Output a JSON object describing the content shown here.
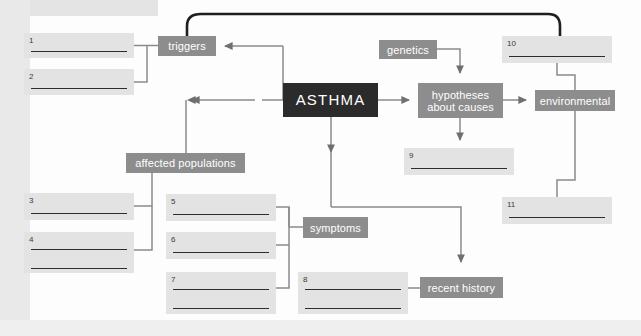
{
  "diagram": {
    "type": "concept-map",
    "colors": {
      "node_grey": "#8d8d8d",
      "node_dark": "#2b2b2b",
      "blank_fill": "#e3e3e3",
      "connector": "#7a7a7a",
      "page": "#fdfdfd",
      "margin": "#e9e9e9",
      "rule_line": "#2e2e2e"
    },
    "nodes": [
      {
        "id": "triggers",
        "label": "triggers",
        "style": "grey",
        "x": 158,
        "y": 36,
        "w": 58,
        "h": 20
      },
      {
        "id": "asthma",
        "label": "ASTHMA",
        "style": "dark",
        "x": 283,
        "y": 83,
        "w": 95,
        "h": 34
      },
      {
        "id": "genetics",
        "label": "genetics",
        "style": "grey",
        "x": 379,
        "y": 40,
        "w": 58,
        "h": 19
      },
      {
        "id": "hypotheses",
        "label": "hypotheses about causes",
        "style": "grey",
        "x": 418,
        "y": 83,
        "w": 85,
        "h": 35
      },
      {
        "id": "environmental",
        "label": "environmental",
        "style": "grey",
        "x": 535,
        "y": 90,
        "w": 80,
        "h": 21
      },
      {
        "id": "affected",
        "label": "affected populations",
        "style": "grey",
        "x": 126,
        "y": 153,
        "w": 119,
        "h": 20
      },
      {
        "id": "symptoms",
        "label": "symptoms",
        "style": "grey",
        "x": 303,
        "y": 217,
        "w": 65,
        "h": 21
      },
      {
        "id": "recent",
        "label": "recent history",
        "style": "grey",
        "x": 420,
        "y": 277,
        "w": 83,
        "h": 21
      }
    ],
    "blanks": [
      {
        "id": "blank-1",
        "number": "1",
        "x": 24,
        "y": 33,
        "w": 110,
        "h": 25,
        "lines": 1
      },
      {
        "id": "blank-2",
        "number": "2",
        "x": 24,
        "y": 69,
        "w": 110,
        "h": 26,
        "lines": 1
      },
      {
        "id": "blank-3",
        "number": "3",
        "x": 24,
        "y": 193,
        "w": 110,
        "h": 27,
        "lines": 1
      },
      {
        "id": "blank-4",
        "number": "4",
        "x": 24,
        "y": 232,
        "w": 110,
        "h": 41,
        "lines": 2
      },
      {
        "id": "blank-5",
        "number": "5",
        "x": 166,
        "y": 194,
        "w": 110,
        "h": 27,
        "lines": 1
      },
      {
        "id": "blank-6",
        "number": "6",
        "x": 166,
        "y": 232,
        "w": 110,
        "h": 27,
        "lines": 1
      },
      {
        "id": "blank-7",
        "number": "7",
        "x": 166,
        "y": 272,
        "w": 110,
        "h": 42,
        "lines": 2
      },
      {
        "id": "blank-8",
        "number": "8",
        "x": 298,
        "y": 272,
        "w": 110,
        "h": 42,
        "lines": 2
      },
      {
        "id": "blank-9",
        "number": "9",
        "x": 404,
        "y": 148,
        "w": 110,
        "h": 27,
        "lines": 1
      },
      {
        "id": "blank-10",
        "number": "10",
        "x": 502,
        "y": 36,
        "w": 110,
        "h": 27,
        "lines": 1
      },
      {
        "id": "blank-11",
        "number": "11",
        "x": 502,
        "y": 197,
        "w": 110,
        "h": 27,
        "lines": 1
      }
    ],
    "connectors": [
      {
        "from": "blank-1",
        "to": "triggers",
        "kind": "bracket"
      },
      {
        "from": "blank-2",
        "to": "triggers",
        "kind": "bracket"
      },
      {
        "from": "asthma",
        "to": "triggers",
        "kind": "arrow-left"
      },
      {
        "from": "asthma",
        "to": "affected",
        "kind": "arrow-left-down"
      },
      {
        "from": "asthma",
        "to": "hypotheses",
        "kind": "arrow-right"
      },
      {
        "from": "asthma",
        "to": "symptoms",
        "kind": "arrow-down"
      },
      {
        "from": "genetics",
        "to": "hypotheses",
        "kind": "arrow-up"
      },
      {
        "from": "hypotheses",
        "to": "environmental",
        "kind": "arrow-right"
      },
      {
        "from": "hypotheses",
        "to": "blank-9",
        "kind": "arrow-down"
      },
      {
        "from": "blank-10",
        "to": "environmental",
        "kind": "line"
      },
      {
        "from": "environmental",
        "to": "blank-11",
        "kind": "line"
      },
      {
        "from": "triggers",
        "to": "blank-10",
        "kind": "curve-top"
      },
      {
        "from": "affected",
        "to": "blank-3",
        "kind": "bracket"
      },
      {
        "from": "affected",
        "to": "blank-4",
        "kind": "bracket"
      },
      {
        "from": "blank-5",
        "to": "symptoms",
        "kind": "bracket"
      },
      {
        "from": "blank-6",
        "to": "symptoms",
        "kind": "bracket"
      },
      {
        "from": "blank-7",
        "to": "symptoms",
        "kind": "bracket"
      },
      {
        "from": "symptoms",
        "to": "recent",
        "kind": "arrow-down-right"
      },
      {
        "from": "blank-8",
        "to": "recent",
        "kind": "line"
      }
    ]
  }
}
